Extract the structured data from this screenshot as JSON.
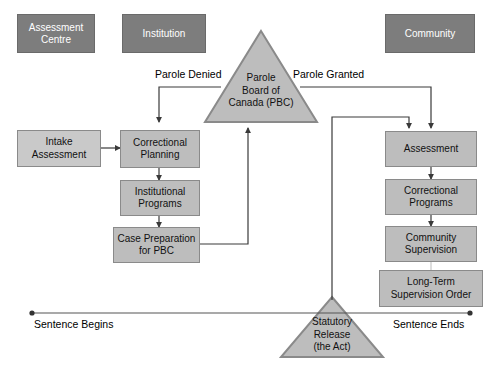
{
  "diagram": {
    "colors": {
      "header_fill": "#7d7d7d",
      "header_text": "#ffffff",
      "box_fill": "#bdbdbd",
      "box_fill_light": "#c9c9c9",
      "box_stroke": "#8a8a8a",
      "triangle_fill": "#bdbdbd",
      "triangle_stroke": "#8a8a8a",
      "connector": "#3a3a3a",
      "faint_connector": "#cfcfcf",
      "timeline": "#555555",
      "text": "#111111"
    },
    "headers": [
      {
        "id": "assessment-centre",
        "label_line1": "Assessment",
        "label_line2": "Centre"
      },
      {
        "id": "institution",
        "label_line1": "Institution",
        "label_line2": ""
      },
      {
        "id": "community",
        "label_line1": "Community",
        "label_line2": ""
      }
    ],
    "decisions": [
      {
        "id": "parole-board",
        "line1": "Parole",
        "line2": "Board of",
        "line3": "Canada (PBC)"
      },
      {
        "id": "statutory-release",
        "line1": "Statutory",
        "line2": "Release",
        "line3": "(the Act)"
      }
    ],
    "institution_flow": [
      {
        "id": "intake-assessment",
        "line1": "Intake",
        "line2": "Assessment"
      },
      {
        "id": "correctional-planning",
        "line1": "Correctional",
        "line2": "Planning"
      },
      {
        "id": "institutional-programs",
        "line1": "Institutional",
        "line2": "Programs"
      },
      {
        "id": "case-preparation",
        "line1": "Case Preparation",
        "line2": "for PBC"
      }
    ],
    "community_flow": [
      {
        "id": "assessment",
        "line1": "Assessment",
        "line2": ""
      },
      {
        "id": "correctional-programs",
        "line1": "Correctional",
        "line2": "Programs"
      },
      {
        "id": "community-supervision",
        "line1": "Community",
        "line2": "Supervision"
      },
      {
        "id": "long-term-supervision-order",
        "line1": "Long-Term",
        "line2": "Supervision Order"
      }
    ],
    "edge_labels": {
      "parole_denied": "Parole Denied",
      "parole_granted": "Parole Granted"
    },
    "timeline": {
      "start_label": "Sentence Begins",
      "end_label": "Sentence Ends"
    }
  }
}
